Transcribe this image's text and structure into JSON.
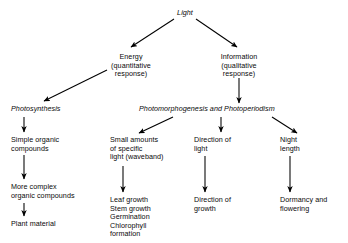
{
  "diagram": {
    "background_color": "#ffffff",
    "line_color": "#000000",
    "text_color": "#0a0a0a",
    "nodes": {
      "light": "Light",
      "energy": "Energy\n(quantitative\nresponse)",
      "information": "Information\n(qualitative\nresponse)",
      "photosynthesis": "Photosynthesis",
      "photomorphogenesis": "Photomorphogenesis and Photoperiodism",
      "simple_organic": "Simple organic\ncompounds",
      "more_complex": "More complex\norganic compounds",
      "plant_material": "Plant material",
      "small_amounts": "Small amounts\nof specific\nlight (waveband)",
      "leaf_growth_list": "Leaf growth\nStem growth\nGermination\nChlorophyll\nformation",
      "direction_of_light": "Direction of\nlight",
      "direction_of_growth": "Direction of\ngrowth",
      "night_length": "Night\nlength",
      "dormancy": "Dormancy and\nflowering"
    },
    "edges": [
      {
        "name": "light-to-energy",
        "from": "light",
        "to": "energy"
      },
      {
        "name": "light-to-information",
        "from": "light",
        "to": "information"
      },
      {
        "name": "energy-to-photosynthesis",
        "from": "energy",
        "to": "photosynthesis"
      },
      {
        "name": "information-to-photomorphogenesis",
        "from": "information",
        "to": "photomorphogenesis"
      },
      {
        "name": "photosynthesis-to-simple-organic",
        "from": "photosynthesis",
        "to": "simple_organic"
      },
      {
        "name": "simple-organic-to-more-complex",
        "from": "simple_organic",
        "to": "more_complex"
      },
      {
        "name": "more-complex-to-plant-material",
        "from": "more_complex",
        "to": "plant_material"
      },
      {
        "name": "photomorphogenesis-to-small-amounts",
        "from": "photomorphogenesis",
        "to": "small_amounts"
      },
      {
        "name": "photomorphogenesis-to-direction-of-light",
        "from": "photomorphogenesis",
        "to": "direction_of_light"
      },
      {
        "name": "photomorphogenesis-to-night-length",
        "from": "photomorphogenesis",
        "to": "night_length"
      },
      {
        "name": "small-amounts-to-leaf-growth",
        "from": "small_amounts",
        "to": "leaf_growth_list"
      },
      {
        "name": "direction-of-light-to-direction-of-growth",
        "from": "direction_of_light",
        "to": "direction_of_growth"
      },
      {
        "name": "night-length-to-dormancy",
        "from": "night_length",
        "to": "dormancy"
      }
    ]
  }
}
